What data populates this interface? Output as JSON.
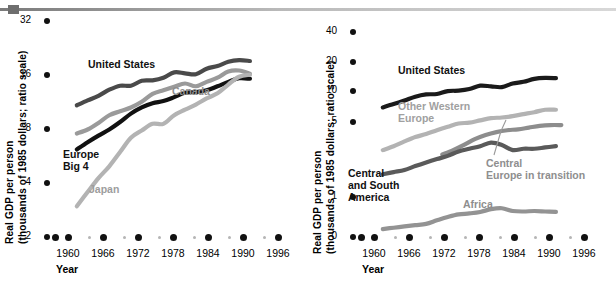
{
  "figure": {
    "top_rule": "horizontal-rule"
  },
  "panels": [
    {
      "id": "left",
      "axis": {
        "ylabel_line1": "Real GDP per person",
        "ylabel_line2": "(thousands of 1985 dollars; ratio scale)",
        "xtitle": "Year",
        "yticks": [
          "32",
          "16",
          "8",
          "4",
          "2"
        ],
        "xticks": [
          "1960",
          "1966",
          "1972",
          "1978",
          "1984",
          "1990",
          "1996"
        ]
      },
      "labels": [
        {
          "name": "series-label-united-states",
          "text": "United States"
        },
        {
          "name": "series-label-canada",
          "text": "Canada"
        },
        {
          "name": "series-label-europe-big-4",
          "text": "Europe\nBig 4"
        },
        {
          "name": "series-label-japan",
          "text": "Japan"
        }
      ]
    },
    {
      "id": "right",
      "axis": {
        "ylabel_line1": "Real GDP per person",
        "ylabel_line2": "(thousands of 1985 dollars; ratio scale)",
        "xtitle": "Year",
        "yticks": [
          "40",
          "20",
          "10",
          "5",
          "1",
          "0"
        ],
        "xticks": [
          "1960",
          "1966",
          "1972",
          "1978",
          "1984",
          "1990",
          "1996"
        ]
      },
      "labels": [
        {
          "name": "series-label-united-states",
          "text": "United States"
        },
        {
          "name": "series-label-other-western-europe",
          "text": "Other Western\nEurope"
        },
        {
          "name": "series-label-central-europe-in-transition",
          "text": "Central\nEurope in transition"
        },
        {
          "name": "series-label-central-and-south-america",
          "text": "Central\nand South\nAmerica"
        },
        {
          "name": "series-label-africa",
          "text": "Africa"
        }
      ]
    }
  ],
  "chart_data": [
    {
      "type": "line",
      "panel": "left",
      "title": "",
      "xlabel": "Year",
      "ylabel": "Real GDP per person (thousands of 1985 dollars; ratio scale)",
      "yscale": "log",
      "ylim": [
        2,
        32
      ],
      "ytick_values": [
        32,
        16,
        8,
        4,
        2
      ],
      "xlim": [
        1958,
        1997
      ],
      "xtick_values": [
        1960,
        1966,
        1972,
        1978,
        1984,
        1990,
        1996
      ],
      "grid": false,
      "legend": "inline-labels",
      "x": [
        1960,
        1962,
        1964,
        1966,
        1968,
        1970,
        1972,
        1974,
        1976,
        1978,
        1980,
        1982,
        1984,
        1986,
        1988,
        1990,
        1992
      ],
      "series": [
        {
          "name": "United States",
          "color": "#4a4a4a",
          "values": [
            10.9,
            11.6,
            12.3,
            13.3,
            14.0,
            14.0,
            14.9,
            15.0,
            15.5,
            16.6,
            16.4,
            16.2,
            17.4,
            18.0,
            19.0,
            19.4,
            19.2
          ]
        },
        {
          "name": "Canada",
          "color": "#9a9a9a",
          "values": [
            7.6,
            8.0,
            8.7,
            9.6,
            10.1,
            10.6,
            11.4,
            12.6,
            13.2,
            13.8,
            14.4,
            13.9,
            14.7,
            15.5,
            16.8,
            17.0,
            16.3
          ]
        },
        {
          "name": "Europe Big 4",
          "color": "#111111",
          "values": [
            6.2,
            6.8,
            7.4,
            8.0,
            8.8,
            9.8,
            10.6,
            11.2,
            11.5,
            12.1,
            12.8,
            12.9,
            13.2,
            13.9,
            14.7,
            15.4,
            15.3
          ]
        },
        {
          "name": "Japan",
          "color": "#b3b3b3",
          "values": [
            3.0,
            3.6,
            4.3,
            5.0,
            6.0,
            7.2,
            7.9,
            8.6,
            8.6,
            9.6,
            10.3,
            11.0,
            11.9,
            12.7,
            14.2,
            15.7,
            16.1
          ]
        }
      ]
    },
    {
      "type": "line",
      "panel": "right",
      "title": "",
      "xlabel": "Year",
      "ylabel": "Real GDP per person (thousands of 1985 dollars; ratio scale)",
      "yscale": "log",
      "ylim": [
        0.6,
        40
      ],
      "ytick_values": [
        40,
        20,
        10,
        5,
        1,
        0
      ],
      "xlim": [
        1958,
        1997
      ],
      "xtick_values": [
        1960,
        1966,
        1972,
        1978,
        1984,
        1990,
        1996
      ],
      "grid": false,
      "legend": "inline-labels",
      "x": [
        1960,
        1962,
        1964,
        1966,
        1968,
        1970,
        1972,
        1974,
        1976,
        1978,
        1980,
        1982,
        1984,
        1986,
        1988,
        1990,
        1992
      ],
      "series": [
        {
          "name": "United States",
          "color": "#1a1a1a",
          "values": [
            8.6,
            9.2,
            9.9,
            10.7,
            11.2,
            11.3,
            12.0,
            12.1,
            12.5,
            13.4,
            13.2,
            13.0,
            14.0,
            14.5,
            15.4,
            15.7,
            15.6
          ]
        },
        {
          "name": "Other Western Europe",
          "color": "#b3b3b3",
          "values": [
            3.6,
            3.9,
            4.3,
            4.7,
            5.0,
            5.4,
            5.8,
            6.2,
            6.3,
            6.6,
            6.9,
            7.0,
            7.2,
            7.5,
            7.8,
            8.2,
            8.2
          ]
        },
        {
          "name": "Central Europe in transition",
          "color": "#8d8d8d",
          "x_start": 1971,
          "values": [
            3.3,
            3.6,
            4.0,
            4.5,
            4.9,
            5.2,
            5.4,
            5.5,
            5.7,
            5.9,
            6.0,
            6.0
          ]
        },
        {
          "name": "Central and South America",
          "color": "#5a5a5a",
          "values": [
            2.2,
            2.3,
            2.4,
            2.6,
            2.8,
            3.0,
            3.2,
            3.5,
            3.7,
            3.9,
            4.2,
            4.0,
            3.6,
            3.7,
            3.7,
            3.8,
            3.9
          ]
        },
        {
          "name": "Africa",
          "color": "#939393",
          "values": [
            0.72,
            0.74,
            0.76,
            0.78,
            0.8,
            0.86,
            0.92,
            0.97,
            0.99,
            1.02,
            1.08,
            1.1,
            1.04,
            1.03,
            1.04,
            1.03,
            1.02
          ]
        }
      ]
    }
  ]
}
